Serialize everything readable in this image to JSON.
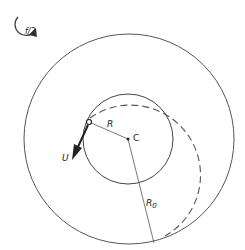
{
  "diagram": {
    "rotation_label": "f/2",
    "radius_label": "R",
    "center_label": "C",
    "velocity_label": "U",
    "outer_radius_label": "R",
    "outer_radius_subscript": "0",
    "colors": {
      "line": "#444444",
      "text": "#222222",
      "background": "#ffffff"
    }
  }
}
